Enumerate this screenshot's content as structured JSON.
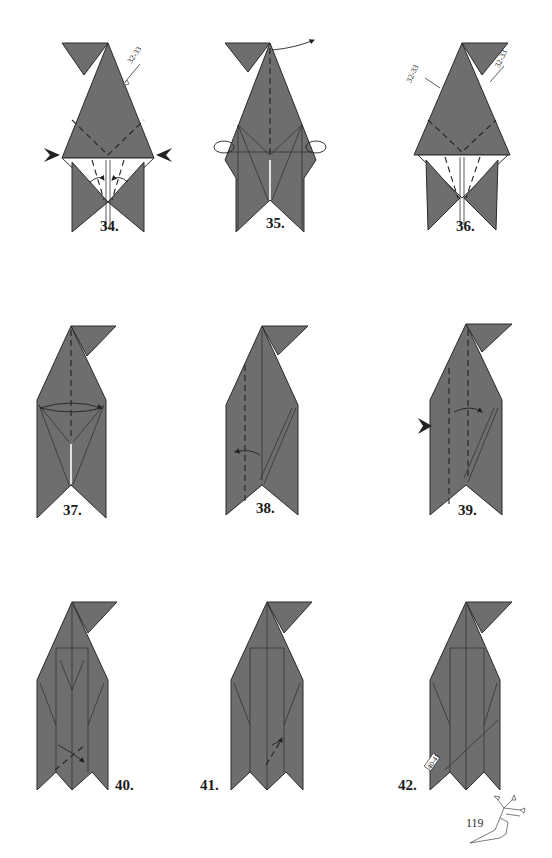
{
  "page": {
    "number": "119",
    "background": "#ffffff",
    "paper_color": "#6e6e6e"
  },
  "steps": [
    {
      "label": "34.",
      "reference": "32-33"
    },
    {
      "label": "35."
    },
    {
      "label": "36.",
      "references": [
        "32-33",
        "32-33"
      ]
    },
    {
      "label": "37."
    },
    {
      "label": "38."
    },
    {
      "label": "39."
    },
    {
      "label": "40."
    },
    {
      "label": "41."
    },
    {
      "label": "42.",
      "reference": "40-41"
    }
  ]
}
